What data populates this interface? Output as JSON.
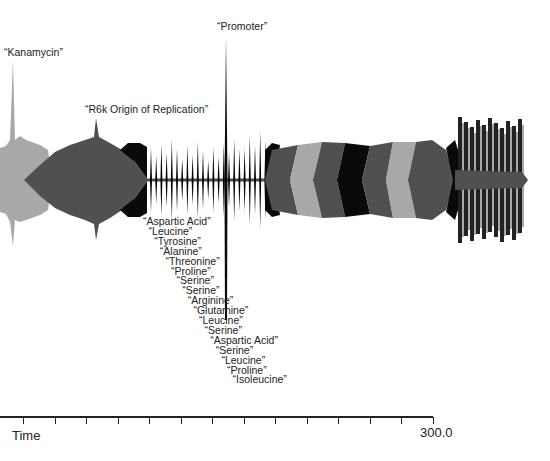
{
  "chart_data": {
    "type": "area",
    "title": "",
    "xlabel": "Time",
    "ylabel": "",
    "xlim": [
      0,
      300.0
    ],
    "x_end_label": "300.0",
    "grid": false,
    "annotations": [
      {
        "text": "“Kanamycin”",
        "x": 13
      },
      {
        "text": "“R6k Origin of Replication”",
        "x": 96
      },
      {
        "text": "“Promoter”",
        "x": 226
      }
    ],
    "sequence_labels": [
      "“Aspartic Acid”",
      "“Leucine”",
      "“Tyrosine”",
      "“Alanine”",
      "“Threonine”",
      "“Proline”",
      "“Serine”",
      "“Serine”",
      "“Arginine”",
      "“Glutamine”",
      "“Leucine”",
      "“Serine”",
      "“Aspartic Acid”",
      "“Serine”",
      "“Leucine”",
      "“Proline”",
      "“Isoleucine”"
    ],
    "segments": [
      {
        "name": "Kanamycin",
        "start": 0,
        "end": 15,
        "shade": "light"
      },
      {
        "name": "R6k Origin of Replication",
        "start": 6,
        "end": 102,
        "shade": "dark"
      },
      {
        "name": "black block",
        "start": 82,
        "end": 101,
        "shade": "black"
      },
      {
        "name": "amino acid spikes",
        "start": 101,
        "end": 183,
        "shade": "black"
      },
      {
        "name": "chevrons",
        "start": 183,
        "end": 314,
        "shade": "mixed"
      },
      {
        "name": "striped end",
        "start": 314,
        "end": 365,
        "shade": "striped"
      }
    ],
    "colors": {
      "light": "#a8a8a8",
      "dark": "#505050",
      "black": "#0a0a0a"
    }
  },
  "axis": {
    "label": "Time",
    "end_value": "300.0",
    "tick_count": 14
  }
}
